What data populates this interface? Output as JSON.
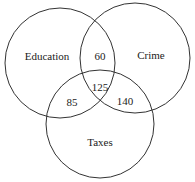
{
  "diagram": {
    "type": "venn",
    "sets": [
      {
        "name": "Education",
        "cx": 60,
        "cy": 63,
        "r": 55,
        "label_x": 47,
        "label_y": 57
      },
      {
        "name": "Crime",
        "cx": 135,
        "cy": 58,
        "r": 55,
        "label_x": 151,
        "label_y": 56
      },
      {
        "name": "Taxes",
        "cx": 100,
        "cy": 124,
        "r": 54,
        "label_x": 100,
        "label_y": 143
      }
    ],
    "regions": [
      {
        "sets": [
          "Education",
          "Crime"
        ],
        "value": "60",
        "x": 100,
        "y": 57
      },
      {
        "sets": [
          "Education",
          "Crime",
          "Taxes"
        ],
        "value": "125",
        "x": 100,
        "y": 88
      },
      {
        "sets": [
          "Education",
          "Taxes"
        ],
        "value": "85",
        "x": 72,
        "y": 103
      },
      {
        "sets": [
          "Crime",
          "Taxes"
        ],
        "value": "140",
        "x": 125,
        "y": 102
      }
    ],
    "stroke_color": "#333333"
  }
}
